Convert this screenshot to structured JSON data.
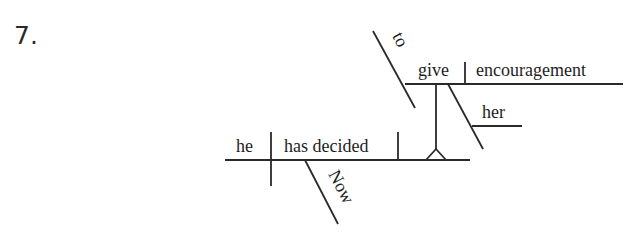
{
  "problem": {
    "number": "7."
  },
  "diagram": {
    "type": "sentence-diagram",
    "sentence_words": [
      "Now",
      "he",
      "has decided",
      "to",
      "give",
      "her",
      "encouragement"
    ],
    "main_clause": {
      "subject": "he",
      "verb": "has decided",
      "adverb_modifier": "Now"
    },
    "infinitive_phrase": {
      "role": "direct object (on pedestal)",
      "marker": "to",
      "verb": "give",
      "direct_object": "encouragement",
      "indirect_object": "her"
    },
    "colors": {
      "ink": "#2a2a2a",
      "background": "#ffffff"
    }
  }
}
